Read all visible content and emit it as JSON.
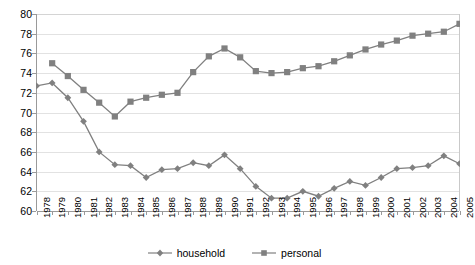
{
  "chart_data": {
    "type": "line",
    "title": "",
    "subtitle": "",
    "xlabel": "",
    "ylabel": "",
    "xlim": [
      1978,
      2005
    ],
    "ylim": [
      60,
      80
    ],
    "yticks": [
      60,
      62,
      64,
      66,
      68,
      70,
      72,
      74,
      76,
      78,
      80
    ],
    "grid": true,
    "legend_position": "bottom-center",
    "categories": [
      "1978",
      "1979",
      "1980",
      "1981",
      "1982",
      "1983",
      "1984",
      "1985",
      "1986",
      "1987",
      "1988",
      "1989",
      "1990",
      "1991",
      "1992",
      "1993",
      "1994",
      "1995",
      "1996",
      "1997",
      "1998",
      "1999",
      "2000",
      "2001",
      "2002",
      "2003",
      "2004",
      "2005"
    ],
    "series": [
      {
        "name": "household",
        "marker": "diamond",
        "color": "#808080",
        "values": [
          72.7,
          73.0,
          71.5,
          69.1,
          66.0,
          64.7,
          64.6,
          63.4,
          64.2,
          64.3,
          64.9,
          64.6,
          65.7,
          64.3,
          62.5,
          61.3,
          61.3,
          62.0,
          61.5,
          62.3,
          63.0,
          62.6,
          63.4,
          64.3,
          64.4,
          64.6,
          65.6,
          64.8
        ]
      },
      {
        "name": "personal",
        "marker": "square",
        "color": "#808080",
        "values": [
          null,
          75.0,
          73.7,
          72.3,
          71.0,
          69.6,
          71.1,
          71.5,
          71.8,
          72.0,
          74.1,
          75.7,
          76.5,
          75.6,
          74.2,
          74.0,
          74.1,
          74.5,
          74.7,
          75.2,
          75.8,
          76.4,
          76.9,
          77.3,
          77.8,
          78.0,
          78.2,
          79.0
        ]
      }
    ],
    "legend": [
      "household",
      "personal"
    ]
  }
}
